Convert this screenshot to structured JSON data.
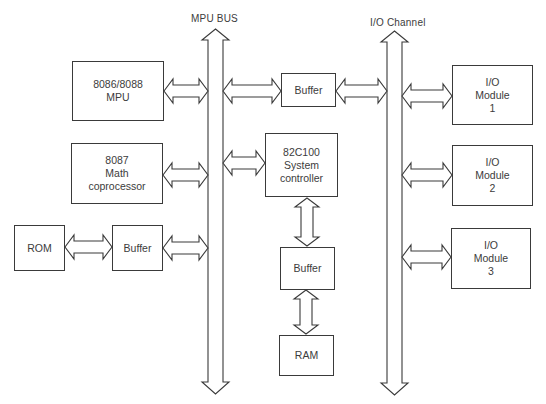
{
  "diagram": {
    "buses": [
      {
        "id": "mpu-bus",
        "label": "MPU  BUS",
        "x": 215.5,
        "half_width": 7.5,
        "head_half": 13.5,
        "top": 29,
        "top_head_end": 40,
        "bottom_head_start": 382,
        "bottom": 394,
        "label_x": 191,
        "label_y": 13
      },
      {
        "id": "io-channel",
        "label": "I/O Channel",
        "x": 394.5,
        "half_width": 7.5,
        "head_half": 13.5,
        "top": 31,
        "top_head_end": 42,
        "bottom_head_start": 383,
        "bottom": 395,
        "label_x": 370,
        "label_y": 17
      }
    ],
    "blocks": [
      {
        "id": "mpu",
        "lines": [
          "8086/8088",
          "MPU"
        ],
        "x": 72,
        "y": 61,
        "w": 92,
        "h": 60
      },
      {
        "id": "math-coprocessor",
        "lines": [
          "8087",
          "Math",
          "coprocessor"
        ],
        "x": 71,
        "y": 143,
        "w": 92,
        "h": 61
      },
      {
        "id": "rom",
        "lines": [
          "ROM"
        ],
        "x": 14,
        "y": 225,
        "w": 51,
        "h": 46
      },
      {
        "id": "rom-buffer",
        "lines": [
          "Buffer"
        ],
        "x": 112,
        "y": 225,
        "w": 51,
        "h": 46
      },
      {
        "id": "top-buffer",
        "lines": [
          "Buffer"
        ],
        "x": 281,
        "y": 73,
        "w": 55,
        "h": 34
      },
      {
        "id": "system-controller",
        "lines": [
          "82C100",
          "System",
          "controller"
        ],
        "x": 265,
        "y": 133,
        "w": 73,
        "h": 64
      },
      {
        "id": "ram-buffer",
        "lines": [
          "Buffer"
        ],
        "x": 280,
        "y": 247,
        "w": 55,
        "h": 43
      },
      {
        "id": "ram",
        "lines": [
          "RAM"
        ],
        "x": 279,
        "y": 335,
        "w": 55,
        "h": 41
      },
      {
        "id": "io-module-1",
        "lines": [
          "I/O",
          "Module",
          "1"
        ],
        "x": 452,
        "y": 65,
        "w": 81,
        "h": 60
      },
      {
        "id": "io-module-2",
        "lines": [
          "I/O",
          "Module",
          "2"
        ],
        "x": 452,
        "y": 145,
        "w": 81,
        "h": 61
      },
      {
        "id": "io-module-3",
        "lines": [
          "I/O",
          "Module",
          "3"
        ],
        "x": 451,
        "y": 228,
        "w": 80,
        "h": 61
      }
    ],
    "connections": [
      {
        "id": "mpu-to-mpu-bus",
        "dir": "h",
        "x1": 164,
        "x2": 208,
        "y": 91
      },
      {
        "id": "mpu-bus-to-top-buffer",
        "dir": "h",
        "x1": 223,
        "x2": 281,
        "y": 91
      },
      {
        "id": "top-buffer-to-io-channel",
        "dir": "h",
        "x1": 336,
        "x2": 387,
        "y": 91
      },
      {
        "id": "io-channel-to-module-1",
        "dir": "h",
        "x1": 402,
        "x2": 452,
        "y": 96
      },
      {
        "id": "coprocessor-to-mpu-bus",
        "dir": "h",
        "x1": 163,
        "x2": 208,
        "y": 175
      },
      {
        "id": "mpu-bus-to-system-controller",
        "dir": "h",
        "x1": 223,
        "x2": 265,
        "y": 163
      },
      {
        "id": "io-channel-to-module-2",
        "dir": "h",
        "x1": 402,
        "x2": 452,
        "y": 175
      },
      {
        "id": "rom-to-buffer",
        "dir": "h",
        "x1": 65,
        "x2": 112,
        "y": 247
      },
      {
        "id": "buffer-to-mpu-bus",
        "dir": "h",
        "x1": 163,
        "x2": 208,
        "y": 248
      },
      {
        "id": "io-channel-to-module-3",
        "dir": "h",
        "x1": 402,
        "x2": 451,
        "y": 257
      },
      {
        "id": "system-controller-to-ram-buffer",
        "dir": "v",
        "y1": 198,
        "y2": 246,
        "x": 307
      },
      {
        "id": "ram-buffer-to-ram",
        "dir": "v",
        "y1": 290,
        "y2": 334,
        "x": 306
      }
    ],
    "style": {
      "line_color": "#3a3a3a",
      "text_color": "#3c3c3c",
      "background": "#ffffff"
    }
  }
}
